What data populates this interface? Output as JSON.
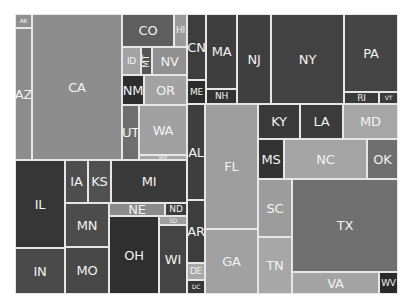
{
  "chart_data": {
    "type": "treemap",
    "title": "",
    "groups": [
      {
        "name": "West",
        "items": [
          "AK",
          "AZ",
          "CA",
          "CO",
          "HI",
          "ID",
          "MT",
          "NV",
          "NM",
          "OR",
          "UT",
          "WA",
          "WY"
        ]
      },
      {
        "name": "Midwest",
        "items": [
          "IL",
          "IN",
          "IA",
          "KS",
          "MI",
          "MN",
          "MO",
          "NE",
          "ND",
          "OH",
          "SD",
          "WI"
        ]
      },
      {
        "name": "Northeast",
        "items": [
          "CN",
          "ME",
          "MA",
          "NH",
          "NJ",
          "NY",
          "PA",
          "RI",
          "VT"
        ]
      },
      {
        "name": "South",
        "items": [
          "AL",
          "AR",
          "DE",
          "DC",
          "FL",
          "GA",
          "KY",
          "LA",
          "MD",
          "MS",
          "NC",
          "OK",
          "SC",
          "TN",
          "TX",
          "VA",
          "WV"
        ]
      }
    ],
    "cells": [
      {
        "label": "AK",
        "x": 15,
        "y": 14,
        "w": 17,
        "h": 14,
        "color": "#8f8f8f",
        "size": "xs"
      },
      {
        "label": "AZ",
        "x": 15,
        "y": 28,
        "w": 17,
        "h": 132,
        "color": "#8c8c8c",
        "size": "md"
      },
      {
        "label": "CA",
        "x": 32,
        "y": 14,
        "w": 90,
        "h": 146,
        "color": "#8d8d8d",
        "size": "md"
      },
      {
        "label": "CO",
        "x": 122,
        "y": 14,
        "w": 52,
        "h": 33,
        "color": "#5e5e5e",
        "size": "md"
      },
      {
        "label": "HI",
        "x": 174,
        "y": 14,
        "w": 13,
        "h": 33,
        "color": "#9a9a9a",
        "size": "sm"
      },
      {
        "label": "ID",
        "x": 122,
        "y": 47,
        "w": 19,
        "h": 28,
        "color": "#a3a3a3",
        "size": "sm"
      },
      {
        "label": "MT",
        "x": 141,
        "y": 47,
        "w": 11,
        "h": 28,
        "color": "#555555",
        "size": "vert"
      },
      {
        "label": "NV",
        "x": 152,
        "y": 47,
        "w": 35,
        "h": 28,
        "color": "#909090",
        "size": "md"
      },
      {
        "label": "NM",
        "x": 122,
        "y": 75,
        "w": 22,
        "h": 30,
        "color": "#2e2e2e",
        "size": "md"
      },
      {
        "label": "OR",
        "x": 144,
        "y": 75,
        "w": 43,
        "h": 30,
        "color": "#a2a2a2",
        "size": "md"
      },
      {
        "label": "UT",
        "x": 122,
        "y": 105,
        "w": 17,
        "h": 55,
        "color": "#6e6e6e",
        "size": "md"
      },
      {
        "label": "WA",
        "x": 139,
        "y": 105,
        "w": 48,
        "h": 50,
        "color": "#a0a0a0",
        "size": "md"
      },
      {
        "label": "WY",
        "x": 139,
        "y": 155,
        "w": 48,
        "h": 5,
        "color": "#a5a5a5",
        "size": "xs"
      },
      {
        "label": "IL",
        "x": 15,
        "y": 160,
        "w": 50,
        "h": 88,
        "color": "#363636",
        "size": "md"
      },
      {
        "label": "IN",
        "x": 15,
        "y": 248,
        "w": 50,
        "h": 46,
        "color": "#4a4a4a",
        "size": "md"
      },
      {
        "label": "IA",
        "x": 65,
        "y": 160,
        "w": 23,
        "h": 43,
        "color": "#4e4e4e",
        "size": "md"
      },
      {
        "label": "KS",
        "x": 88,
        "y": 160,
        "w": 23,
        "h": 43,
        "color": "#505050",
        "size": "md"
      },
      {
        "label": "MI",
        "x": 111,
        "y": 160,
        "w": 76,
        "h": 43,
        "color": "#3a3a3a",
        "size": "md"
      },
      {
        "label": "MN",
        "x": 65,
        "y": 203,
        "w": 44,
        "h": 44,
        "color": "#4c4c4c",
        "size": "md"
      },
      {
        "label": "MO",
        "x": 65,
        "y": 247,
        "w": 44,
        "h": 47,
        "color": "#484848",
        "size": "md"
      },
      {
        "label": "NE",
        "x": 109,
        "y": 203,
        "w": 56,
        "h": 13,
        "color": "#8a8a8a",
        "size": "md"
      },
      {
        "label": "ND",
        "x": 165,
        "y": 203,
        "w": 22,
        "h": 13,
        "color": "#3c3c3c",
        "size": "sm"
      },
      {
        "label": "OH",
        "x": 109,
        "y": 216,
        "w": 50,
        "h": 78,
        "color": "#2f2f2f",
        "size": "md"
      },
      {
        "label": "SD",
        "x": 159,
        "y": 216,
        "w": 28,
        "h": 9,
        "color": "#9e9e9e",
        "size": "xs"
      },
      {
        "label": "WI",
        "x": 159,
        "y": 225,
        "w": 28,
        "h": 69,
        "color": "#444444",
        "size": "md"
      },
      {
        "label": "CN",
        "x": 187,
        "y": 14,
        "w": 19,
        "h": 66,
        "color": "#3d3d3d",
        "size": "md"
      },
      {
        "label": "ME",
        "x": 187,
        "y": 80,
        "w": 19,
        "h": 24,
        "color": "#2c2c2c",
        "size": "sm"
      },
      {
        "label": "MA",
        "x": 206,
        "y": 14,
        "w": 31,
        "h": 75,
        "color": "#3e3e3e",
        "size": "md"
      },
      {
        "label": "NH",
        "x": 206,
        "y": 89,
        "w": 31,
        "h": 15,
        "color": "#333333",
        "size": "sm"
      },
      {
        "label": "NJ",
        "x": 237,
        "y": 14,
        "w": 34,
        "h": 90,
        "color": "#3f3f3f",
        "size": "md"
      },
      {
        "label": "NY",
        "x": 271,
        "y": 14,
        "w": 73,
        "h": 90,
        "color": "#424242",
        "size": "md"
      },
      {
        "label": "PA",
        "x": 344,
        "y": 14,
        "w": 54,
        "h": 78,
        "color": "#454545",
        "size": "md"
      },
      {
        "label": "RI",
        "x": 344,
        "y": 92,
        "w": 35,
        "h": 12,
        "color": "#3a3a3a",
        "size": "sm"
      },
      {
        "label": "VT",
        "x": 379,
        "y": 92,
        "w": 19,
        "h": 12,
        "color": "#3b3b3b",
        "size": "xs"
      },
      {
        "label": "AL",
        "x": 187,
        "y": 104,
        "w": 18,
        "h": 96,
        "color": "#3e3e3e",
        "size": "md"
      },
      {
        "label": "AR",
        "x": 187,
        "y": 200,
        "w": 18,
        "h": 63,
        "color": "#3d3d3d",
        "size": "md"
      },
      {
        "label": "DE",
        "x": 187,
        "y": 263,
        "w": 18,
        "h": 17,
        "color": "#a8a8a8",
        "size": "sm"
      },
      {
        "label": "DC",
        "x": 187,
        "y": 280,
        "w": 18,
        "h": 14,
        "color": "#363636",
        "size": "xs"
      },
      {
        "label": "FL",
        "x": 205,
        "y": 104,
        "w": 53,
        "h": 125,
        "color": "#9d9d9d",
        "size": "md"
      },
      {
        "label": "GA",
        "x": 205,
        "y": 229,
        "w": 53,
        "h": 65,
        "color": "#a1a1a1",
        "size": "md"
      },
      {
        "label": "KY",
        "x": 258,
        "y": 104,
        "w": 42,
        "h": 35,
        "color": "#3a3a3a",
        "size": "md"
      },
      {
        "label": "LA",
        "x": 300,
        "y": 104,
        "w": 43,
        "h": 35,
        "color": "#3b3b3b",
        "size": "md"
      },
      {
        "label": "MD",
        "x": 343,
        "y": 104,
        "w": 55,
        "h": 35,
        "color": "#a6a6a6",
        "size": "md"
      },
      {
        "label": "MS",
        "x": 258,
        "y": 139,
        "w": 26,
        "h": 40,
        "color": "#333333",
        "size": "md"
      },
      {
        "label": "NC",
        "x": 284,
        "y": 139,
        "w": 83,
        "h": 40,
        "color": "#a4a4a4",
        "size": "md"
      },
      {
        "label": "OK",
        "x": 367,
        "y": 139,
        "w": 31,
        "h": 40,
        "color": "#6f6f6f",
        "size": "md"
      },
      {
        "label": "SC",
        "x": 258,
        "y": 179,
        "w": 34,
        "h": 58,
        "color": "#9c9c9c",
        "size": "md"
      },
      {
        "label": "TN",
        "x": 258,
        "y": 237,
        "w": 34,
        "h": 57,
        "color": "#a7a7a7",
        "size": "md"
      },
      {
        "label": "TX",
        "x": 292,
        "y": 179,
        "w": 106,
        "h": 93,
        "color": "#707070",
        "size": "md"
      },
      {
        "label": "VA",
        "x": 292,
        "y": 272,
        "w": 87,
        "h": 22,
        "color": "#a3a3a3",
        "size": "md"
      },
      {
        "label": "WV",
        "x": 379,
        "y": 272,
        "w": 19,
        "h": 22,
        "color": "#2a2a2a",
        "size": "sm"
      }
    ]
  }
}
